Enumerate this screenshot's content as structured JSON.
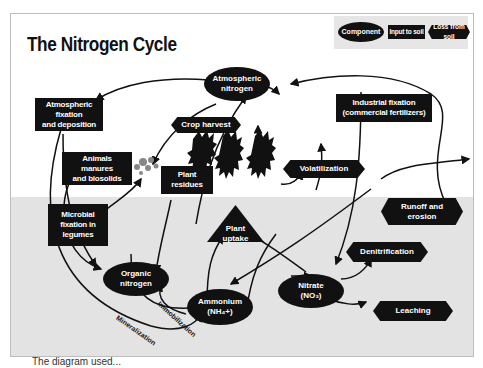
{
  "title": "The Nitrogen Cycle",
  "legend": {
    "component": "Component",
    "input": "Input to soil",
    "loss": "Loss from soil"
  },
  "components": {
    "atmospheric_nitrogen": "Atmospheric\nnitrogen",
    "organic_nitrogen": "Organic\nnitrogen",
    "ammonium": "Ammonium\n(NH₄+)",
    "nitrate": "Nitrate\n(NO₃)"
  },
  "inputs": {
    "atmospheric_fixation": "Atmospheric\nfixation\nand deposition",
    "industrial_fixation": "Industrial fixation\n(commercial fertilizers)",
    "animal_manures": "Animals\nmanures\nand biosolids",
    "plant_residues": "Plant\nresidues",
    "microbial_fixation": "Microbial\nfixation in\nlegumes"
  },
  "losses": {
    "crop_harvest": "Crop harvest",
    "volatilization": "Volatilization",
    "runoff_erosion": "Runoff and\nerosion",
    "denitrification": "Denitrification",
    "leaching": "Leaching"
  },
  "processes": {
    "plant_uptake": "Plant\nuptake",
    "immobilization": "Immobilization",
    "mineralization": "Mineralization"
  },
  "caption": "The diagram used...",
  "colors": {
    "shape": "#111111",
    "soil": "#e3e3e3",
    "legend_bg": "#e6e6e6",
    "frame": "#bdbdbd"
  }
}
